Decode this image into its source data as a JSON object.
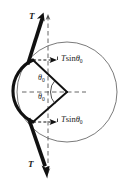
{
  "figure": {
    "background_color": "#ffffff",
    "stroke_color": "#1a1a1a",
    "thin_stroke_color": "#5a5a5a",
    "width": 130,
    "height": 185
  },
  "labels": {
    "tension_top": "T",
    "tension_bottom": "T",
    "force_component_top_symbol": "T",
    "force_component_top_function": "sin",
    "force_component_top_angle": "θ",
    "force_component_top_subscript": "0",
    "force_component_bottom_symbol": "T",
    "force_component_bottom_function": "sin",
    "force_component_bottom_angle": "θ",
    "force_component_bottom_subscript": "0",
    "angle_upper": "θ",
    "angle_upper_subscript": "0",
    "angle_lower": "θ",
    "angle_lower_subscript": "0"
  },
  "geometry": {
    "circle_center_x": 67,
    "circle_center_y": 92,
    "circle_radius": 50,
    "apex_x": 67,
    "apex_y": 92,
    "contact_point_upper_x": 33,
    "contact_point_upper_y": 60,
    "contact_point_lower_x": 33,
    "contact_point_lower_y": 122,
    "arrow_top_tip_x": 43,
    "arrow_top_tip_y": 13,
    "arrow_bottom_tip_x": 47,
    "arrow_bottom_tip_y": 178,
    "dashed_vertical_x": 48,
    "dashed_horizontal_y": 92
  }
}
